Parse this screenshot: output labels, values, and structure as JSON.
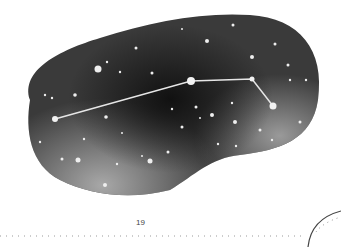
{
  "page": {
    "page_number": "19",
    "illustration": {
      "subject": "constellation",
      "style": "watercolor night sky blob",
      "constellation_stars": [
        {
          "x": 55,
          "y": 119,
          "r": 3
        },
        {
          "x": 191,
          "y": 81,
          "r": 4
        },
        {
          "x": 252,
          "y": 79,
          "r": 2.5
        },
        {
          "x": 273,
          "y": 106,
          "r": 3.5
        }
      ],
      "colors": {
        "sky_dark": "#1e1e1e",
        "sky_mid": "#555555",
        "sky_light": "#9a9a9a",
        "star": "#f2f2f2",
        "line": "#e6e6e6"
      }
    },
    "footer": {
      "dotted_rule": true,
      "corner_arc": true
    }
  }
}
